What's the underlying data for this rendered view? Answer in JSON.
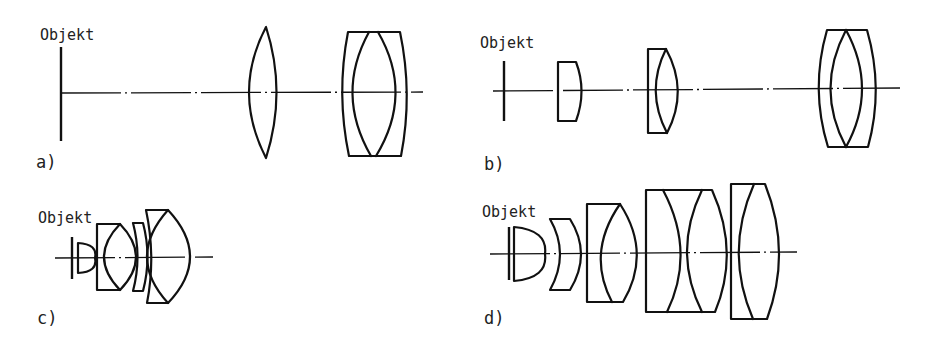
{
  "figure": {
    "panels": [
      {
        "id": "a",
        "label": "a)",
        "object_label": "Objekt",
        "elements": [
          "object-plane",
          "biconvex-lens",
          "cemented-triplet"
        ]
      },
      {
        "id": "b",
        "label": "b)",
        "object_label": "Objekt",
        "elements": [
          "object-plane",
          "plano-convex-lens",
          "cemented-doublet",
          "cemented-triplet"
        ]
      },
      {
        "id": "c",
        "label": "c)",
        "object_label": "Objekt",
        "elements": [
          "object-plane",
          "plano-convex-front-lens",
          "cemented-doublet",
          "meniscus-lens",
          "cemented-doublet"
        ]
      },
      {
        "id": "d",
        "label": "d)",
        "object_label": "Objekt",
        "elements": [
          "object-plane",
          "plano-convex-front-lens",
          "meniscus-lens",
          "cemented-doublet",
          "cemented-doublet-pair",
          "cemented-doublet"
        ]
      }
    ],
    "colors": {
      "line": "#111111",
      "text": "#222222",
      "background": "#ffffff"
    }
  }
}
